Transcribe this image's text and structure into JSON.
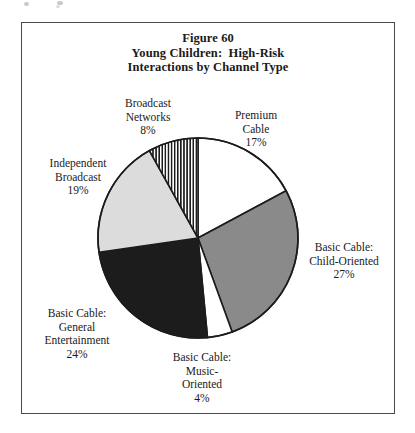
{
  "page": {
    "figure_number": "Figure 60",
    "title_line_1": "Figure 60",
    "title_line_2": "Young Children:  High-Risk",
    "title_line_3": "Interactions by Channel Type"
  },
  "chart_data": {
    "type": "pie",
    "title": "Figure 60 Young Children:  High-Risk Interactions by Channel Type",
    "xlabel": "",
    "ylabel": "",
    "legend_position": "none",
    "grid": false,
    "start_angle_deg": 0,
    "direction": "clockwise",
    "units": "percent",
    "categories": [
      "Premium Cable",
      "Basic Cable: Child-Oriented",
      "Basic Cable: Music-Oriented",
      "Basic Cable: General Entertainment",
      "Independent Broadcast",
      "Broadcast Networks"
    ],
    "values": [
      17,
      27,
      4,
      24,
      19,
      8
    ],
    "slices": [
      {
        "name": "premium-cable",
        "label_line_1": "Premium",
        "label_line_2": "Cable",
        "value_label": "17%",
        "value": 17,
        "fill_style": "solid",
        "fill_color": "#ffffff"
      },
      {
        "name": "basic-cable-child-oriented",
        "label_line_1": "Basic Cable:",
        "label_line_2": "Child-Oriented",
        "value_label": "27%",
        "value": 27,
        "fill_style": "solid",
        "fill_color": "#8a8a8a"
      },
      {
        "name": "basic-cable-music-oriented",
        "label_line_1": "Basic Cable:",
        "label_line_2": "Music-",
        "label_line_3": "Oriented",
        "value_label": "4%",
        "value": 4,
        "fill_style": "solid",
        "fill_color": "#ffffff"
      },
      {
        "name": "basic-cable-general-entertainment",
        "label_line_1": "Basic Cable:",
        "label_line_2": "General",
        "label_line_3": "Entertainment",
        "value_label": "24%",
        "value": 24,
        "fill_style": "solid",
        "fill_color": "#1c1c1c"
      },
      {
        "name": "independent-broadcast",
        "label_line_1": "Independent",
        "label_line_2": "Broadcast",
        "value_label": "19%",
        "value": 19,
        "fill_style": "solid",
        "fill_color": "#dcdcdc"
      },
      {
        "name": "broadcast-networks",
        "label_line_1": "Broadcast",
        "label_line_2": "Networks",
        "value_label": "8%",
        "value": 8,
        "fill_style": "vertical-stripes",
        "fill_color": "#ffffff",
        "stripe_color": "#1c1c1c"
      }
    ],
    "colors": {
      "outline": "#1c1c1c",
      "frame": "#4a4a4a",
      "background": "#ffffff",
      "text": "#1a1a1a"
    }
  }
}
